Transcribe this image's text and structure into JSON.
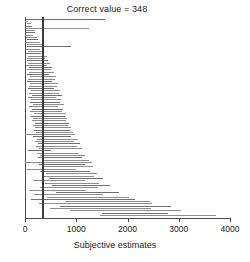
{
  "chart_data": {
    "type": "bar",
    "orientation": "horizontal-intervals",
    "title": "Correct value = 348",
    "xlabel": "Subjective estimates",
    "ylabel": "",
    "xlim": [
      0,
      4000
    ],
    "ylim": [
      0,
      80
    ],
    "grid": false,
    "legend": null,
    "reference_line": {
      "label": "Correct value = 348",
      "value": 348
    },
    "xticks": [
      0,
      1000,
      2000,
      3000,
      4000
    ],
    "xtick_labels": [
      "0",
      "1000",
      "2000",
      "3000",
      "4000"
    ],
    "categories": [
      "p01",
      "p02",
      "p03",
      "p04",
      "p05",
      "p06",
      "p07",
      "p08",
      "p09",
      "p10",
      "p11",
      "p12",
      "p13",
      "p14",
      "p15",
      "p16",
      "p17",
      "p18",
      "p19",
      "p20",
      "p21",
      "p22",
      "p23",
      "p24",
      "p25",
      "p26",
      "p27",
      "p28",
      "p29",
      "p30",
      "p31",
      "p32",
      "p33",
      "p34",
      "p35",
      "p36",
      "p37",
      "p38",
      "p39",
      "p40",
      "p41",
      "p42",
      "p43",
      "p44",
      "p45",
      "p46",
      "p47",
      "p48",
      "p49",
      "p50",
      "p51",
      "p52",
      "p53",
      "p54",
      "p55",
      "p56",
      "p57",
      "p58",
      "p59",
      "p60",
      "p61",
      "p62",
      "p63",
      "p64",
      "p65",
      "p66",
      "p67",
      "p68",
      "p69",
      "p70",
      "p71",
      "p72",
      "p73",
      "p74",
      "p75",
      "p76",
      "p77",
      "p78",
      "p79",
      "p80"
    ],
    "intervals": [
      [
        20,
        1560
      ],
      [
        0,
        60
      ],
      [
        30,
        110
      ],
      [
        0,
        140
      ],
      [
        20,
        1250
      ],
      [
        20,
        200
      ],
      [
        10,
        190
      ],
      [
        0,
        150
      ],
      [
        20,
        230
      ],
      [
        30,
        260
      ],
      [
        0,
        290
      ],
      [
        40,
        330
      ],
      [
        30,
        900
      ],
      [
        20,
        300
      ],
      [
        60,
        380
      ],
      [
        20,
        320
      ],
      [
        50,
        430
      ],
      [
        40,
        400
      ],
      [
        30,
        450
      ],
      [
        60,
        480
      ],
      [
        20,
        420
      ],
      [
        70,
        520
      ],
      [
        40,
        500
      ],
      [
        80,
        560
      ],
      [
        30,
        470
      ],
      [
        90,
        600
      ],
      [
        60,
        580
      ],
      [
        40,
        530
      ],
      [
        100,
        640
      ],
      [
        70,
        620
      ],
      [
        50,
        560
      ],
      [
        110,
        680
      ],
      [
        80,
        660
      ],
      [
        130,
        720
      ],
      [
        60,
        600
      ],
      [
        120,
        700
      ],
      [
        90,
        690
      ],
      [
        150,
        760
      ],
      [
        70,
        650
      ],
      [
        140,
        740
      ],
      [
        100,
        720
      ],
      [
        170,
        800
      ],
      [
        110,
        780
      ],
      [
        160,
        820
      ],
      [
        130,
        800
      ],
      [
        190,
        860
      ],
      [
        150,
        840
      ],
      [
        200,
        900
      ],
      [
        170,
        880
      ],
      [
        220,
        940
      ],
      [
        0,
        980
      ],
      [
        160,
        900
      ],
      [
        240,
        1030
      ],
      [
        190,
        960
      ],
      [
        250,
        1080
      ],
      [
        210,
        1010
      ],
      [
        270,
        1120
      ],
      [
        60,
        500
      ],
      [
        230,
        1060
      ],
      [
        300,
        1180
      ],
      [
        250,
        1110
      ],
      [
        330,
        1240
      ],
      [
        0,
        1300
      ],
      [
        280,
        1180
      ],
      [
        360,
        1320
      ],
      [
        30,
        990
      ],
      [
        300,
        1260
      ],
      [
        400,
        1400
      ],
      [
        350,
        1350
      ],
      [
        460,
        1520
      ],
      [
        160,
        1180
      ],
      [
        390,
        1450
      ],
      [
        520,
        1650
      ],
      [
        290,
        1420
      ],
      [
        80,
        1200
      ],
      [
        600,
        1830
      ],
      [
        180,
        1520
      ],
      [
        420,
        2020
      ],
      [
        120,
        2140
      ],
      [
        790,
        2440
      ],
      [
        280,
        2480
      ],
      [
        680,
        2840
      ],
      [
        480,
        2450
      ],
      [
        880,
        3050
      ],
      [
        1500,
        2790
      ],
      [
        1460,
        3730
      ]
    ]
  }
}
